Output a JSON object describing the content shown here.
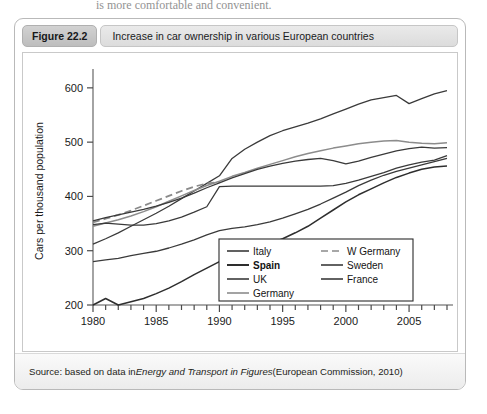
{
  "page": {
    "clipped_top_text": "is more comfortable and convenient."
  },
  "figure": {
    "badge": "Figure 22.2",
    "title": "Increase in car ownership in various European countries",
    "source_prefix": "Source: based on data in ",
    "source_italic": "Energy and Transport in Figures",
    "source_suffix": " (European Commission, 2010)"
  },
  "chart_data": {
    "type": "line",
    "title": "Increase in car ownership in various European countries",
    "xlabel": "",
    "ylabel": "Cars per thousand population",
    "xlim": [
      1980,
      2008
    ],
    "ylim": [
      200,
      620
    ],
    "yticks": [
      200,
      300,
      400,
      500,
      600
    ],
    "xticks": [
      1980,
      1985,
      1990,
      1995,
      2000,
      2005
    ],
    "xtick_labels": [
      "1980",
      "1985",
      "1990",
      "1995",
      "2000",
      "2005"
    ],
    "ytick_labels": [
      "200",
      "300",
      "400",
      "500",
      "600"
    ],
    "grid": false,
    "legend_position": "lower-right-inside",
    "x": [
      1980,
      1981,
      1982,
      1983,
      1984,
      1985,
      1986,
      1987,
      1988,
      1989,
      1990,
      1991,
      1992,
      1993,
      1994,
      1995,
      1996,
      1997,
      1998,
      1999,
      2000,
      2001,
      2002,
      2003,
      2004,
      2005,
      2006,
      2007,
      2008
    ],
    "series": [
      {
        "name": "Italy",
        "style": "solid",
        "color": "#3a3a3a",
        "width": 1.3,
        "values": [
          312,
          322,
          333,
          345,
          357,
          369,
          382,
          396,
          410,
          424,
          438,
          470,
          487,
          500,
          512,
          521,
          528,
          535,
          543,
          552,
          561,
          570,
          578,
          582,
          586,
          571,
          580,
          589,
          595
        ]
      },
      {
        "name": "Spain",
        "style": "solid",
        "color": "#2e2e2e",
        "width": 1.5,
        "values": [
          200,
          212,
          200,
          206,
          212,
          221,
          231,
          243,
          256,
          268,
          280,
          290,
          300,
          306,
          313,
          322,
          333,
          345,
          360,
          375,
          390,
          403,
          414,
          425,
          435,
          443,
          450,
          454,
          456
        ]
      },
      {
        "name": "UK",
        "style": "solid",
        "color": "#3a3a3a",
        "width": 1.3,
        "values": [
          280,
          283,
          286,
          291,
          295,
          299,
          305,
          312,
          320,
          329,
          337,
          341,
          344,
          348,
          353,
          360,
          368,
          376,
          386,
          397,
          408,
          420,
          430,
          439,
          446,
          452,
          458,
          464,
          470
        ]
      },
      {
        "name": "Germany",
        "style": "solid",
        "color": "#8c8c8c",
        "width": 1.5,
        "values": [
          345,
          351,
          357,
          364,
          372,
          381,
          391,
          401,
          411,
          420,
          428,
          437,
          444,
          452,
          459,
          466,
          473,
          479,
          484,
          489,
          493,
          497,
          500,
          502,
          503,
          500,
          498,
          497,
          499
        ]
      },
      {
        "name": "W Germany",
        "style": "dashed",
        "color": "#8a8a8a",
        "width": 1.8,
        "values": [
          352,
          359,
          366,
          374,
          383,
          392,
          401,
          410,
          418,
          424,
          426,
          null,
          null,
          null,
          null,
          null,
          null,
          null,
          null,
          null,
          null,
          null,
          null,
          null,
          null,
          null,
          null,
          null,
          null
        ]
      },
      {
        "name": "Sweden",
        "style": "solid",
        "color": "#3a3a3a",
        "width": 1.3,
        "values": [
          348,
          351,
          349,
          347,
          347,
          350,
          355,
          362,
          371,
          381,
          418,
          419,
          419,
          419,
          419,
          419,
          419,
          419,
          419,
          420,
          424,
          430,
          437,
          444,
          452,
          458,
          463,
          467,
          475
        ]
      },
      {
        "name": "France",
        "style": "solid",
        "color": "#3a3a3a",
        "width": 1.3,
        "values": [
          355,
          361,
          366,
          371,
          376,
          382,
          389,
          397,
          406,
          416,
          425,
          434,
          442,
          450,
          456,
          461,
          465,
          468,
          470,
          466,
          460,
          465,
          472,
          478,
          484,
          488,
          491,
          489,
          490
        ]
      }
    ],
    "legend": {
      "columns": [
        [
          {
            "label": "Italy",
            "style": "solid",
            "bold": false,
            "color": "#3a3a3a"
          },
          {
            "label": "Spain",
            "style": "solid",
            "bold": true,
            "color": "#2e2e2e"
          },
          {
            "label": "UK",
            "style": "solid",
            "bold": false,
            "color": "#3a3a3a"
          },
          {
            "label": "Germany",
            "style": "solid",
            "bold": false,
            "color": "#8c8c8c"
          }
        ],
        [
          {
            "label": "W Germany",
            "style": "dashed",
            "bold": false,
            "color": "#8a8a8a"
          },
          {
            "label": "Sweden",
            "style": "solid",
            "bold": false,
            "color": "#3a3a3a"
          },
          {
            "label": "France",
            "style": "solid",
            "bold": false,
            "color": "#3a3a3a"
          }
        ]
      ]
    }
  }
}
